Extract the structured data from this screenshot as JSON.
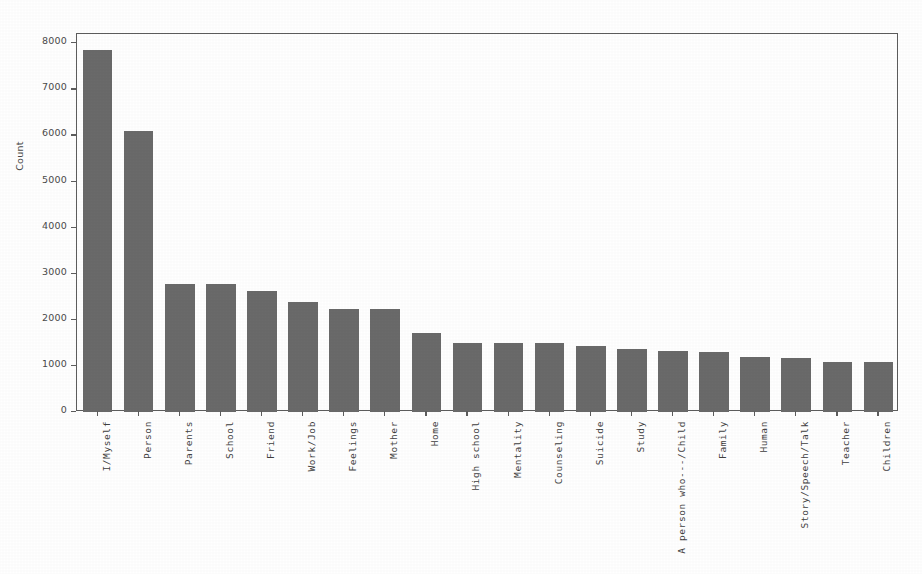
{
  "chart_data": {
    "type": "bar",
    "title": "",
    "subtitle": "",
    "xlabel": "",
    "ylabel": "Count",
    "grid": false,
    "legend": "none",
    "ylim": [
      0,
      8200
    ],
    "yticks": [
      0,
      1000,
      2000,
      3000,
      4000,
      5000,
      6000,
      7000,
      8000
    ],
    "ytick_labels": [
      "0",
      "1000",
      "2000",
      "3000",
      "4000",
      "5000",
      "6000",
      "7000",
      "8000"
    ],
    "bar_color": "#6a6a6a",
    "axis_color": "#5d5d5d",
    "categories": [
      "I/Myself",
      "Person",
      "Parents",
      "School",
      "Friend",
      "Work/Job",
      "Feelings",
      "Mother",
      "Home",
      "High school",
      "Mentality",
      "Counseling",
      "Suicide",
      "Study",
      "A person who---/Child",
      "Family",
      "Human",
      "Story/Speech/Talk",
      "Teacher",
      "Children"
    ],
    "values": [
      7850,
      6090,
      2770,
      2770,
      2625,
      2390,
      2240,
      2240,
      1710,
      1500,
      1500,
      1500,
      1440,
      1360,
      1330,
      1310,
      1200,
      1170,
      1090,
      1090
    ]
  }
}
